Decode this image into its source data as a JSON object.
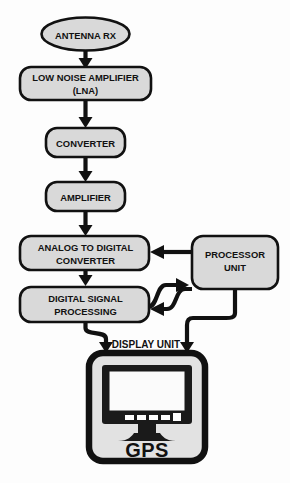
{
  "diagram": {
    "background_color": "#fdfdfd",
    "node_fill_color": "#d9d9d9",
    "outline_color": "#111111",
    "nodes": {
      "antenna": {
        "label": "ANTENNA RX",
        "shape": "ellipse"
      },
      "lna": {
        "label_line1": "LOW NOISE AMPLIFIER",
        "label_line2": "(LNA)",
        "shape": "rounded-rect"
      },
      "converter": {
        "label": "CONVERTER",
        "shape": "rounded-rect"
      },
      "amplifier": {
        "label": "AMPLIFIER",
        "shape": "rounded-rect"
      },
      "adc": {
        "label_line1": "ANALOG TO DIGITAL",
        "label_line2": "CONVERTER",
        "shape": "rounded-rect"
      },
      "dsp": {
        "label_line1": "DIGITAL SIGNAL",
        "label_line2": "PROCESSING",
        "shape": "rounded-rect"
      },
      "processor": {
        "label_line1": "PROCESSOR",
        "label_line2": "UNIT",
        "shape": "rounded-rect"
      },
      "display": {
        "caption": "DISPLAY UNIT",
        "screen_label": "GPS",
        "shape": "monitor-icon"
      }
    },
    "edges": [
      {
        "from": "antenna",
        "to": "lna",
        "style": "straight-down"
      },
      {
        "from": "lna",
        "to": "converter",
        "style": "straight-down"
      },
      {
        "from": "converter",
        "to": "amplifier",
        "style": "straight-down"
      },
      {
        "from": "amplifier",
        "to": "adc",
        "style": "straight-down"
      },
      {
        "from": "adc",
        "to": "dsp",
        "style": "straight-down"
      },
      {
        "from": "processor",
        "to": "adc",
        "style": "horizontal-left"
      },
      {
        "from": "dsp",
        "to": "processor",
        "style": "s-curve-right"
      },
      {
        "from": "processor",
        "to": "dsp",
        "style": "s-curve-left"
      },
      {
        "from": "dsp",
        "to": "display",
        "style": "elbow-down"
      },
      {
        "from": "processor",
        "to": "display",
        "style": "elbow-down"
      }
    ]
  }
}
